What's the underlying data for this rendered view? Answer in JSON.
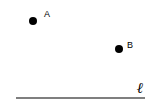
{
  "diagram": {
    "type": "geometry",
    "points": [
      {
        "name": "A",
        "label": "A"
      },
      {
        "name": "B",
        "label": "B"
      }
    ],
    "line": {
      "name": "l",
      "label": "ℓ"
    },
    "colors": {
      "ink": "#000000",
      "background": "#ffffff"
    }
  }
}
